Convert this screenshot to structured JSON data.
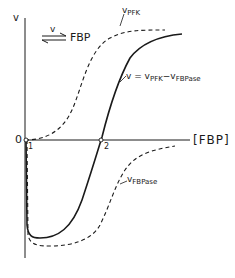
{
  "diagram": {
    "reaction": {
      "rate_symbol": "v",
      "product": "FBP",
      "arrow": "equilibrium-arrows"
    },
    "axes": {
      "y_label": "v",
      "x_label": "[FBP]",
      "origin_label": "0"
    },
    "points": [
      {
        "label": "1"
      },
      {
        "label": "2"
      }
    ],
    "curves": {
      "pfk": {
        "prefix": "v",
        "subscript": "PFK",
        "style": "dashed"
      },
      "fbpase": {
        "prefix": "v",
        "subscript": "FBPase",
        "style": "dashed"
      },
      "net": {
        "lhs": "v = v",
        "sub1": "PFK",
        "minus": "−v",
        "sub2": "FBPase",
        "style": "solid"
      }
    },
    "colors": {
      "ink": "#1a1a1a",
      "background": "#ffffff"
    }
  }
}
